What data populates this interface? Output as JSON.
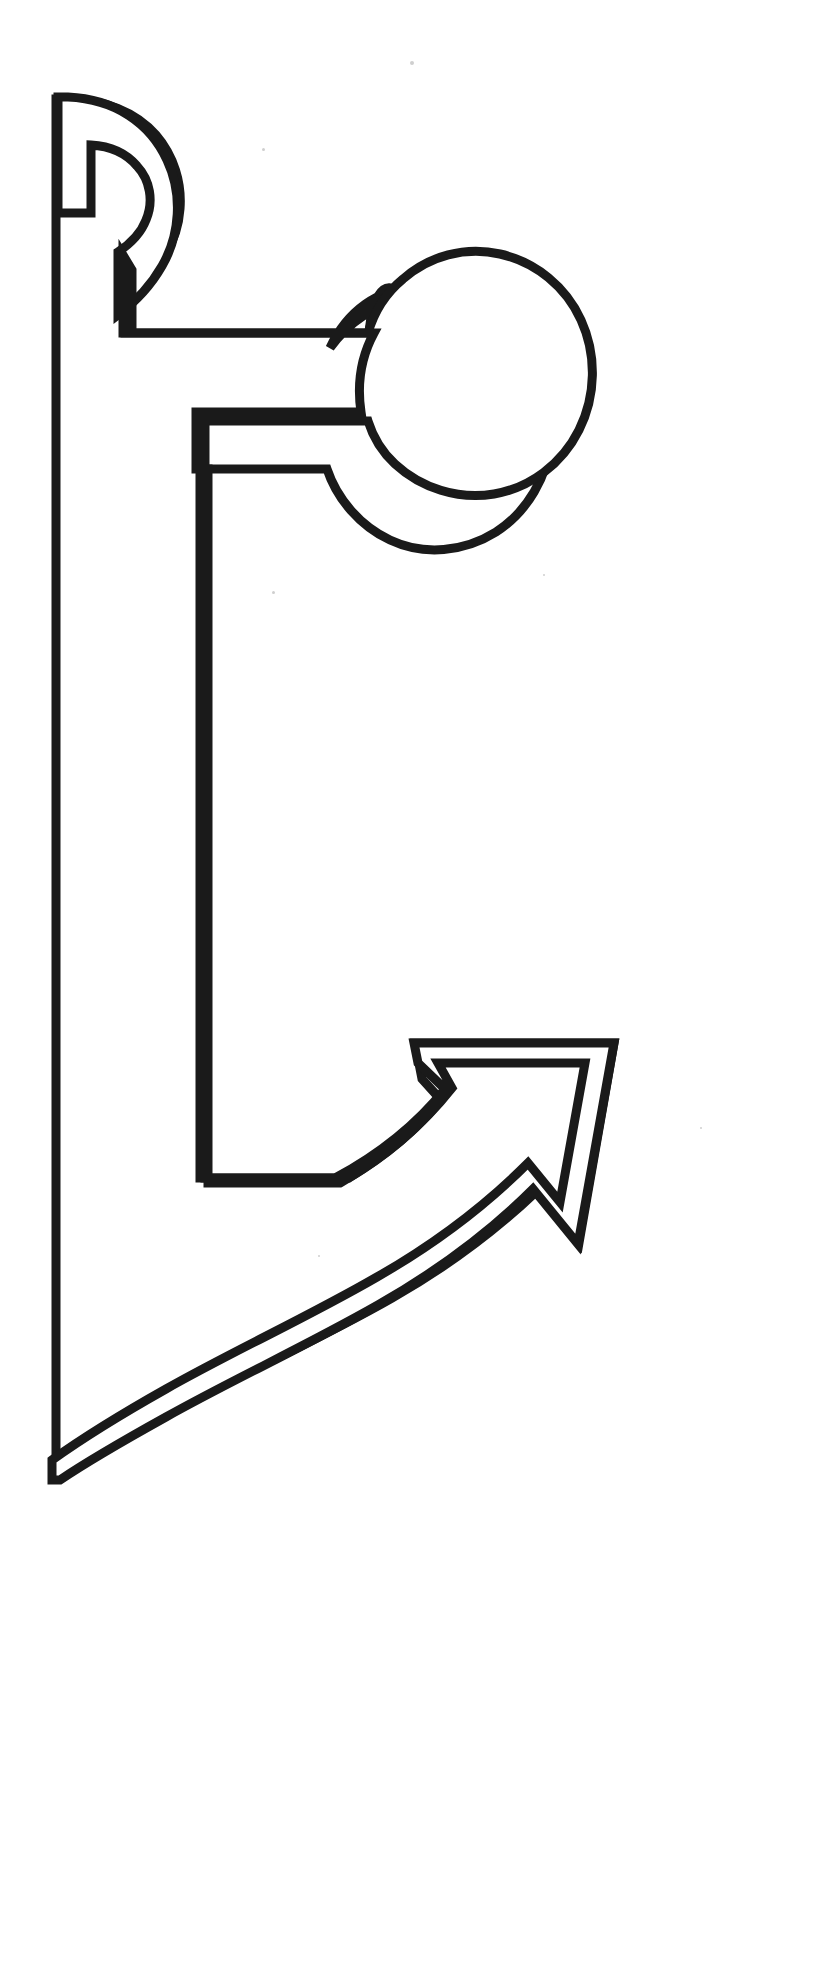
{
  "page": {
    "width": 819,
    "height": 1962,
    "background_color": "#ffffff",
    "stroke_color": "#1a1a1a",
    "fill_color": "#ffffff",
    "stroke_width": 9
  },
  "figure": {
    "name": "hook-arrow-outline",
    "parts": [
      {
        "id": "upper-hook",
        "label": "upper hook with round notch",
        "bbox": [
          48,
          95,
          178,
          335
        ]
      },
      {
        "id": "round-knob",
        "label": "circular knob on upper arm",
        "center": [
          455,
          395
        ],
        "radius": 110
      },
      {
        "id": "vertical-spine",
        "label": "long vertical spine",
        "x": 55,
        "y_top": 97,
        "y_bottom": 1478
      },
      {
        "id": "inner-upright",
        "label": "inner vertical upright",
        "x": 203,
        "y_top": 472,
        "y_bottom": 1178
      },
      {
        "id": "curved-arrow",
        "label": "curved arrow sweeping up and to the right",
        "tip": [
          614,
          1042
        ],
        "notch": [
          536,
          1190
        ]
      }
    ],
    "outline_path": "M 52 1478 L 52 97 L 63 97 C 128 101 173 153 173 213 C 173 268 147 305 123 322 L 123 256 C 138 246 151 231 151 213 C 151 190 135 172 114 167 L 114 249 L 58 249 L 58 97 Z",
    "specks": [
      {
        "x": 411,
        "y": 62,
        "r": 2
      },
      {
        "x": 262,
        "y": 148,
        "r": 1
      },
      {
        "x": 272,
        "y": 591,
        "r": 2
      },
      {
        "x": 543,
        "y": 574,
        "r": 1
      },
      {
        "x": 700,
        "y": 1127,
        "r": 1
      },
      {
        "x": 318,
        "y": 1255,
        "r": 1
      }
    ]
  }
}
